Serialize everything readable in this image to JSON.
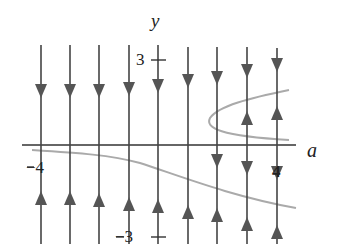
{
  "diagram": {
    "axes": {
      "horizontal_label": "a",
      "vertical_label": "y",
      "tick_labels": {
        "y_pos": "3",
        "y_neg": "−3",
        "a_neg": "−4",
        "a_pos": "4"
      }
    },
    "colors": {
      "axis": "#333333",
      "phase_line": "#444444",
      "arrow": "#555555",
      "equilibrium_curve": "#aaaaaa"
    },
    "phase_lines": [
      {
        "x": 41,
        "arrows": [
          {
            "y": 90,
            "dir": "down"
          },
          {
            "y": 198,
            "dir": "up"
          }
        ]
      },
      {
        "x": 70,
        "arrows": [
          {
            "y": 90,
            "dir": "down"
          },
          {
            "y": 198,
            "dir": "up"
          }
        ]
      },
      {
        "x": 99,
        "arrows": [
          {
            "y": 90,
            "dir": "down"
          },
          {
            "y": 200,
            "dir": "up"
          }
        ]
      },
      {
        "x": 129,
        "arrows": [
          {
            "y": 88,
            "dir": "down"
          },
          {
            "y": 204,
            "dir": "up"
          }
        ]
      },
      {
        "x": 158,
        "arrows": [
          {
            "y": 85,
            "dir": "down"
          },
          {
            "y": 206,
            "dir": "up"
          }
        ]
      },
      {
        "x": 188,
        "arrows": [
          {
            "y": 80,
            "dir": "down"
          },
          {
            "y": 212,
            "dir": "up"
          }
        ]
      },
      {
        "x": 217,
        "arrows": [
          {
            "y": 77,
            "dir": "down"
          },
          {
            "y": 160,
            "dir": "down"
          },
          {
            "y": 215,
            "dir": "up"
          }
        ]
      },
      {
        "x": 247,
        "arrows": [
          {
            "y": 70,
            "dir": "down"
          },
          {
            "y": 118,
            "dir": "up"
          },
          {
            "y": 167,
            "dir": "down"
          },
          {
            "y": 224,
            "dir": "up"
          }
        ]
      },
      {
        "x": 277,
        "arrows": [
          {
            "y": 64,
            "dir": "down"
          },
          {
            "y": 113,
            "dir": "up"
          },
          {
            "y": 172,
            "dir": "down"
          },
          {
            "y": 232,
            "dir": "up"
          }
        ]
      }
    ]
  }
}
